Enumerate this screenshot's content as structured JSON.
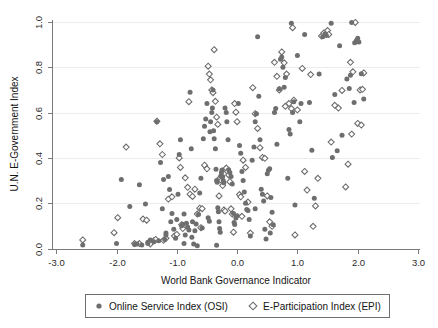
{
  "chart_data": {
    "type": "scatter",
    "title": "",
    "xlabel": "World Bank Governance Indicator",
    "ylabel": "U.N. E-Government Index",
    "xlim": [
      -3.0,
      3.0
    ],
    "ylim": [
      0.0,
      1.0
    ],
    "xticks": [
      "-3.0",
      "-2.0",
      "-1.0",
      "0.0",
      "1.0",
      "2.0",
      "3.0"
    ],
    "xtick_values": [
      -3.0,
      -2.0,
      -1.0,
      0.0,
      1.0,
      2.0,
      3.0
    ],
    "yticks": [
      "0.0",
      "0.2",
      "0.4",
      "0.6",
      "0.8",
      "1.0"
    ],
    "ytick_values": [
      0.0,
      0.2,
      0.4,
      0.6,
      0.8,
      1.0
    ],
    "grid": "horizontal-faint",
    "legend_position": "below-axis",
    "marker_color_osi": "#6e6e6e",
    "marker_color_epi": "#6b6b6b",
    "series": [
      {
        "name": "Online Service Index (OSI)",
        "marker": "filled-circle",
        "points": [
          [
            -2.56,
            0.015
          ],
          [
            -2.0,
            0.022
          ],
          [
            -1.92,
            0.305
          ],
          [
            -1.78,
            0.185
          ],
          [
            -1.7,
            0.018
          ],
          [
            -1.66,
            0.02
          ],
          [
            -1.62,
            0.282
          ],
          [
            -1.58,
            0.016
          ],
          [
            -1.52,
            0.196
          ],
          [
            -1.48,
            0.028
          ],
          [
            -1.44,
            0.038
          ],
          [
            -1.38,
            0.03
          ],
          [
            -1.33,
            0.56
          ],
          [
            -1.3,
            0.034
          ],
          [
            -1.27,
            0.38
          ],
          [
            -1.24,
            0.176
          ],
          [
            -1.22,
            0.305
          ],
          [
            -1.2,
            0.04
          ],
          [
            -1.18,
            0.068
          ],
          [
            -1.14,
            0.318
          ],
          [
            -1.12,
            0.26
          ],
          [
            -1.1,
            0.118
          ],
          [
            -1.08,
            0.155
          ],
          [
            -1.05,
            0.085
          ],
          [
            -1.02,
            0.045
          ],
          [
            -1.0,
            0.128
          ],
          [
            -0.98,
            0.24
          ],
          [
            -0.96,
            0.415
          ],
          [
            -0.94,
            0.48
          ],
          [
            -0.92,
            0.1
          ],
          [
            -0.9,
            0.107
          ],
          [
            -0.88,
            0.152
          ],
          [
            -0.86,
            0.06
          ],
          [
            -0.84,
            0.112
          ],
          [
            -0.82,
            0.095
          ],
          [
            -0.8,
            0.082
          ],
          [
            -0.78,
            0.69
          ],
          [
            -0.76,
            0.44
          ],
          [
            -0.74,
            0.118
          ],
          [
            -0.72,
            0.02
          ],
          [
            -0.7,
            0.078
          ],
          [
            -0.68,
            0.108
          ],
          [
            -0.66,
            0.012
          ],
          [
            -0.64,
            0.15
          ],
          [
            -0.62,
            0.245
          ],
          [
            -0.6,
            0.31
          ],
          [
            -0.58,
            0.09
          ],
          [
            -0.56,
            0.485
          ],
          [
            -0.54,
            0.54
          ],
          [
            -0.52,
            0.572
          ],
          [
            -0.5,
            0.64
          ],
          [
            -0.48,
            0.136
          ],
          [
            -0.46,
            0.12
          ],
          [
            -0.45,
            0.515
          ],
          [
            -0.44,
            0.56
          ],
          [
            -0.42,
            0.6
          ],
          [
            -0.41,
            0.62
          ],
          [
            -0.4,
            0.7
          ],
          [
            -0.39,
            0.52
          ],
          [
            -0.38,
            0.485
          ],
          [
            -0.36,
            0.44
          ],
          [
            -0.35,
            0.35
          ],
          [
            -0.34,
            0.3
          ],
          [
            -0.33,
            0.292
          ],
          [
            -0.32,
            0.18
          ],
          [
            -0.31,
            0.162
          ],
          [
            -0.3,
            0.118
          ],
          [
            -0.29,
            0.088
          ],
          [
            -0.28,
            0.072
          ],
          [
            -0.27,
            0.32
          ],
          [
            -0.26,
            0.335
          ],
          [
            -0.25,
            0.347
          ],
          [
            -0.24,
            0.318
          ],
          [
            -0.23,
            0.3
          ],
          [
            -0.22,
            0.29
          ],
          [
            -0.2,
            0.62
          ],
          [
            -0.18,
            0.6
          ],
          [
            -0.17,
            0.56
          ],
          [
            -0.15,
            0.48
          ],
          [
            -0.14,
            0.348
          ],
          [
            -0.12,
            0.336
          ],
          [
            -0.1,
            0.318
          ],
          [
            -0.08,
            0.285
          ],
          [
            -0.06,
            0.155
          ],
          [
            -0.05,
            0.115
          ],
          [
            -0.04,
            0.106
          ],
          [
            -0.02,
            0.135
          ],
          [
            0.0,
            0.145
          ],
          [
            0.02,
            0.64
          ],
          [
            0.04,
            0.455
          ],
          [
            0.06,
            0.42
          ],
          [
            0.08,
            0.34
          ],
          [
            0.1,
            0.3
          ],
          [
            0.12,
            0.25
          ],
          [
            0.14,
            0.2
          ],
          [
            0.16,
            0.172
          ],
          [
            0.18,
            0.168
          ],
          [
            0.2,
            0.128
          ],
          [
            0.22,
            0.055
          ],
          [
            0.25,
            0.39
          ],
          [
            0.28,
            0.448
          ],
          [
            0.3,
            0.56
          ],
          [
            0.32,
            0.595
          ],
          [
            0.34,
            0.935
          ],
          [
            0.36,
            0.672
          ],
          [
            0.38,
            0.48
          ],
          [
            0.4,
            0.262
          ],
          [
            0.42,
            0.24
          ],
          [
            0.44,
            0.21
          ],
          [
            0.46,
            0.085
          ],
          [
            0.48,
            0.042
          ],
          [
            0.5,
            0.33
          ],
          [
            0.52,
            0.345
          ],
          [
            0.54,
            0.352
          ],
          [
            0.56,
            0.225
          ],
          [
            0.58,
            0.16
          ],
          [
            0.62,
            0.6
          ],
          [
            0.64,
            0.618
          ],
          [
            0.66,
            0.46
          ],
          [
            0.7,
            0.705
          ],
          [
            0.72,
            0.835
          ],
          [
            0.74,
            0.845
          ],
          [
            0.76,
            0.8
          ],
          [
            0.78,
            0.712
          ],
          [
            0.8,
            0.755
          ],
          [
            0.84,
            0.31
          ],
          [
            0.86,
            0.525
          ],
          [
            0.88,
            0.505
          ],
          [
            0.9,
            0.995
          ],
          [
            0.92,
            0.6
          ],
          [
            0.94,
            0.648
          ],
          [
            0.96,
            0.192
          ],
          [
            1.0,
            0.852
          ],
          [
            1.06,
            0.64
          ],
          [
            1.12,
            0.945
          ],
          [
            1.2,
            0.645
          ],
          [
            1.24,
            0.434
          ],
          [
            1.28,
            0.222
          ],
          [
            1.36,
            0.77
          ],
          [
            1.42,
            0.935
          ],
          [
            1.46,
            0.948
          ],
          [
            1.48,
            0.94
          ],
          [
            1.56,
            0.995
          ],
          [
            1.58,
            0.402
          ],
          [
            1.62,
            0.68
          ],
          [
            1.66,
            0.432
          ],
          [
            1.7,
            0.895
          ],
          [
            1.74,
            0.5
          ],
          [
            1.82,
            0.748
          ],
          [
            1.86,
            0.706
          ],
          [
            1.9,
            0.998
          ],
          [
            1.94,
            0.645
          ],
          [
            1.98,
            0.918
          ],
          [
            2.0,
            0.928
          ],
          [
            2.02,
            0.912
          ],
          [
            2.06,
            0.772
          ],
          [
            2.1,
            0.66
          ],
          [
            -1.48,
            0.022
          ],
          [
            -0.88,
            0.022
          ],
          [
            -0.34,
            0.014
          ],
          [
            0.55,
            0.068
          ],
          [
            0.6,
            0.105
          ],
          [
            -1.18,
            0.06
          ],
          [
            -0.75,
            0.05
          ],
          [
            0.3,
            0.175
          ],
          [
            1.04,
            0.56
          ],
          [
            1.88,
            0.765
          ],
          [
            1.95,
            0.908
          ]
        ]
      },
      {
        "name": "E-Participation Index (EPI)",
        "marker": "open-diamond",
        "points": [
          [
            -2.56,
            0.038
          ],
          [
            -2.04,
            0.07
          ],
          [
            -1.98,
            0.136
          ],
          [
            -1.84,
            0.448
          ],
          [
            -1.7,
            0.022
          ],
          [
            -1.62,
            0.022
          ],
          [
            -1.56,
            0.13
          ],
          [
            -1.5,
            0.125
          ],
          [
            -1.44,
            0.02
          ],
          [
            -1.38,
            0.034
          ],
          [
            -1.33,
            0.562
          ],
          [
            -1.28,
            0.462
          ],
          [
            -1.24,
            0.415
          ],
          [
            -1.22,
            0.036
          ],
          [
            -1.18,
            0.045
          ],
          [
            -1.14,
            0.218
          ],
          [
            -1.08,
            0.228
          ],
          [
            -1.04,
            0.055
          ],
          [
            -1.0,
            0.062
          ],
          [
            -0.96,
            0.4
          ],
          [
            -0.94,
            0.358
          ],
          [
            -0.9,
            0.088
          ],
          [
            -0.86,
            0.312
          ],
          [
            -0.82,
            0.27
          ],
          [
            -0.8,
            0.648
          ],
          [
            -0.78,
            0.24
          ],
          [
            -0.74,
            0.23
          ],
          [
            -0.7,
            0.262
          ],
          [
            -0.66,
            0.152
          ],
          [
            -0.62,
            0.178
          ],
          [
            -0.58,
            0.176
          ],
          [
            -0.54,
            0.368
          ],
          [
            -0.5,
            0.352
          ],
          [
            -0.48,
            0.805
          ],
          [
            -0.46,
            0.77
          ],
          [
            -0.44,
            0.745
          ],
          [
            -0.42,
            0.7
          ],
          [
            -0.4,
            0.688
          ],
          [
            -0.38,
            0.878
          ],
          [
            -0.36,
            0.65
          ],
          [
            -0.34,
            0.58
          ],
          [
            -0.32,
            0.548
          ],
          [
            -0.3,
            0.232
          ],
          [
            -0.28,
            0.312
          ],
          [
            -0.26,
            0.3
          ],
          [
            -0.24,
            0.278
          ],
          [
            -0.22,
            0.17
          ],
          [
            -0.2,
            0.165
          ],
          [
            -0.18,
            0.355
          ],
          [
            -0.16,
            0.34
          ],
          [
            -0.14,
            0.325
          ],
          [
            -0.12,
            0.295
          ],
          [
            -0.1,
            0.175
          ],
          [
            -0.08,
            0.152
          ],
          [
            -0.06,
            0.072
          ],
          [
            -0.04,
            0.64
          ],
          [
            -0.02,
            0.602
          ],
          [
            0.0,
            0.56
          ],
          [
            0.04,
            0.238
          ],
          [
            0.06,
            0.228
          ],
          [
            0.1,
            0.39
          ],
          [
            0.14,
            0.358
          ],
          [
            0.18,
            0.205
          ],
          [
            0.22,
            0.068
          ],
          [
            0.26,
            0.71
          ],
          [
            0.3,
            0.595
          ],
          [
            0.34,
            0.53
          ],
          [
            0.38,
            0.445
          ],
          [
            0.42,
            0.402
          ],
          [
            0.46,
            0.398
          ],
          [
            0.5,
            0.232
          ],
          [
            0.54,
            0.118
          ],
          [
            0.58,
            0.098
          ],
          [
            0.62,
            0.822
          ],
          [
            0.66,
            0.76
          ],
          [
            0.7,
            0.7
          ],
          [
            0.74,
            0.868
          ],
          [
            0.78,
            0.82
          ],
          [
            0.82,
            0.77
          ],
          [
            0.86,
            0.64
          ],
          [
            0.9,
            0.618
          ],
          [
            0.92,
            0.975
          ],
          [
            0.94,
            0.655
          ],
          [
            0.96,
            0.06
          ],
          [
            1.0,
            0.612
          ],
          [
            1.08,
            0.795
          ],
          [
            1.12,
            0.34
          ],
          [
            1.16,
            0.258
          ],
          [
            1.22,
            0.768
          ],
          [
            1.26,
            0.098
          ],
          [
            1.3,
            0.188
          ],
          [
            1.34,
            0.31
          ],
          [
            1.4,
            0.938
          ],
          [
            1.44,
            0.952
          ],
          [
            1.5,
            0.962
          ],
          [
            1.56,
            0.47
          ],
          [
            1.62,
            0.632
          ],
          [
            1.68,
            0.62
          ],
          [
            1.74,
            0.698
          ],
          [
            1.8,
            0.272
          ],
          [
            1.84,
            0.372
          ],
          [
            1.88,
            0.822
          ],
          [
            1.92,
            0.78
          ],
          [
            1.96,
            0.998
          ],
          [
            2.0,
            0.552
          ],
          [
            2.04,
            0.7
          ],
          [
            2.06,
            0.545
          ],
          [
            2.08,
            0.703
          ],
          [
            2.1,
            0.775
          ],
          [
            -0.92,
            0.105
          ],
          [
            -0.6,
            0.092
          ],
          [
            0.08,
            0.142
          ],
          [
            0.8,
            0.628
          ],
          [
            1.52,
            0.945
          ],
          [
            1.9,
            0.505
          ],
          [
            -1.35,
            0.04
          ]
        ]
      }
    ]
  },
  "legend": {
    "entries": [
      {
        "label": "Online Service Index (OSI)",
        "marker": "filled-circle-icon"
      },
      {
        "label": "E-Participation Index (EPI)",
        "marker": "open-diamond-icon"
      }
    ]
  }
}
